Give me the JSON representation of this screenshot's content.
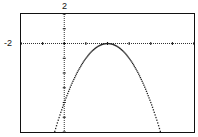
{
  "chart_data": {
    "type": "line",
    "title": "",
    "xlabel": "",
    "ylabel": "",
    "window": {
      "xmin": -2,
      "xmax": 6,
      "ymin": -6,
      "ymax": 2
    },
    "labels": {
      "ymax": "2",
      "xmin": "-2"
    },
    "grid": false,
    "axes": {
      "x_axis_y": 0,
      "y_axis_x": 0,
      "tick_spacing": 1
    },
    "series": [
      {
        "name": "parabola",
        "style": "dotted",
        "description": "downward-opening parabola with vertex near (2, 0)",
        "x": [
          -0.5,
          0,
          0.5,
          1,
          1.5,
          2,
          2.5,
          3,
          3.5,
          4,
          4.5
        ],
        "y": [
          -6.25,
          -4,
          -2.25,
          -1,
          -0.25,
          0,
          -0.25,
          -1,
          -2.25,
          -4,
          -6.25
        ]
      }
    ]
  },
  "colors": {
    "frame": "#111111",
    "plot": "#222222",
    "background": "#ffffff"
  }
}
